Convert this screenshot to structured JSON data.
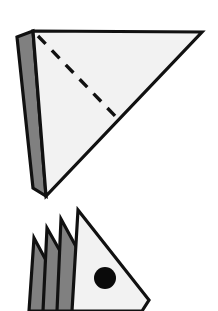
{
  "figure": {
    "type": "line-drawing",
    "background_color": "#FFFFFF",
    "canvas": {
      "width": 218,
      "height": 311
    }
  },
  "palette": {
    "outline": "#111111",
    "paper_face": "#F2F2F2",
    "paper_back": "#808080",
    "dot": "#0A0A0A",
    "background": "#FFFFFF"
  },
  "strokes": {
    "outline_width": 3.2,
    "fold_dash_width": 3.4,
    "fold_dash_pattern": "11 9",
    "inner_edge_width": 2.6
  },
  "steps": [
    {
      "id": "step-upper",
      "name": "folded-triangle-with-fold-line",
      "shapes": {
        "back_flap": {
          "name": "back-flap",
          "fill": "#808080",
          "points": "17,37 33,31 46,196 33,188"
        },
        "front_triangle": {
          "name": "front-triangle",
          "fill": "#F2F2F2",
          "points": "33,31 202,32 46,196"
        },
        "fold_line": {
          "name": "fold-line",
          "style": "dashed",
          "from": {
            "x": 38,
            "y": 36
          },
          "to": {
            "x": 117,
            "y": 118
          }
        }
      }
    },
    {
      "id": "step-lower",
      "name": "pleated-triangle-with-marker-dot",
      "shapes": {
        "pleats": [
          {
            "name": "pleat-outer",
            "fill": "#808080",
            "points": "34,238 48,264 44,311 29,311"
          },
          {
            "name": "pleat-middle",
            "fill": "#808080",
            "points": "47,228 64,258 59,311 43,311"
          },
          {
            "name": "pleat-inner",
            "fill": "#808080",
            "points": "61,219 79,252 74,311 57,311"
          }
        ],
        "front_triangle": {
          "name": "front-triangle",
          "fill": "#F2F2F2",
          "points": "78,210 149,300 142,311 72,311"
        },
        "marker_dot": {
          "name": "marker-dot",
          "fill": "#0A0A0A",
          "cx": 105,
          "cy": 278,
          "r": 11
        }
      }
    }
  ]
}
